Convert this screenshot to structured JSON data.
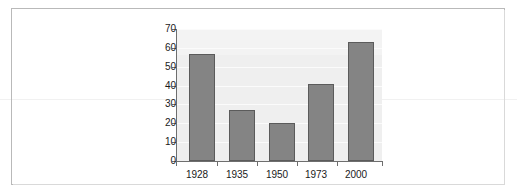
{
  "chart_data": {
    "type": "bar",
    "title": "",
    "subtitle": "",
    "xlabel": "",
    "ylabel": "",
    "categories": [
      "1928",
      "1935",
      "1950",
      "1973",
      "2000"
    ],
    "values": [
      57,
      27,
      20,
      41,
      63
    ],
    "ylim": [
      0,
      70
    ],
    "ytick_labels": [
      "0",
      "10",
      "20",
      "30",
      "40",
      "50",
      "60",
      "70"
    ],
    "ytick_values": [
      0,
      10,
      20,
      30,
      40,
      50,
      60,
      70
    ],
    "grid": true,
    "legend": null,
    "legend_position": "none",
    "annotations": [],
    "series": [
      {
        "name": "",
        "values": [
          57,
          27,
          20,
          41,
          63
        ]
      }
    ],
    "colors": {
      "bar_fill": "#848484",
      "bar_border": "#5b5b5b",
      "plot_background": "#efefef",
      "gridline": "#fbfbfb",
      "axis": "#6e6e6e",
      "tick_label": "#1a1a1a",
      "frame_border": "#b9b9b9",
      "page_rule": "#f1f1f1",
      "page_background": "#ffffff"
    }
  }
}
